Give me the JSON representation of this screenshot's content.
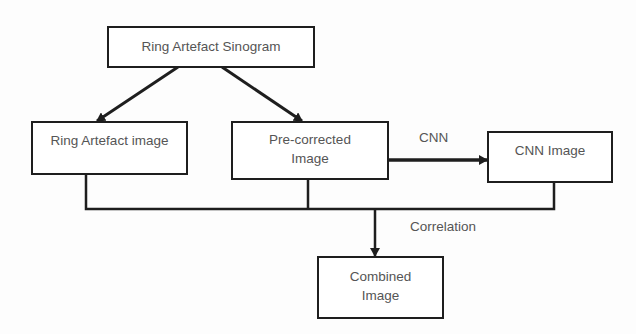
{
  "diagram": {
    "nodes": {
      "sinogram": {
        "label": "Ring Artefact Sinogram"
      },
      "ring_image": {
        "label": "Ring Artefact image"
      },
      "precorrected": {
        "line1": "Pre-corrected",
        "line2": "Image"
      },
      "cnn_image": {
        "label": "CNN Image"
      },
      "combined": {
        "line1": "Combined",
        "line2": "Image"
      }
    },
    "edge_labels": {
      "cnn": "CNN",
      "correlation": "Correlation"
    },
    "edges": [
      {
        "from": "Ring Artefact Sinogram",
        "to": "Ring Artefact image",
        "type": "arrow"
      },
      {
        "from": "Ring Artefact Sinogram",
        "to": "Pre-corrected Image",
        "type": "arrow"
      },
      {
        "from": "Pre-corrected Image",
        "to": "CNN Image",
        "type": "arrow",
        "label": "CNN"
      },
      {
        "from": [
          "Ring Artefact image",
          "Pre-corrected Image",
          "CNN Image"
        ],
        "to": "Combined Image",
        "type": "merge-arrow",
        "label": "Correlation"
      }
    ],
    "colors": {
      "stroke": "#1e1e1e",
      "text": "#555555",
      "background": "#fdfdfd"
    }
  }
}
